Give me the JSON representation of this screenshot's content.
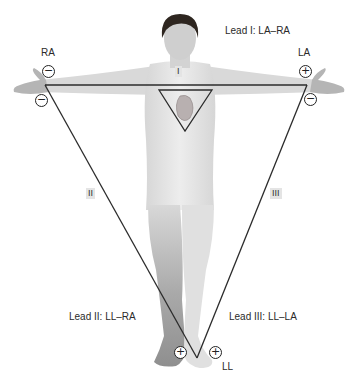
{
  "diagram": {
    "type": "einthoven-triangle",
    "electrodes": {
      "ra": {
        "label": "RA"
      },
      "la": {
        "label": "LA"
      },
      "ll": {
        "label": "LL"
      }
    },
    "leads": [
      {
        "id": "I",
        "roman": "I",
        "caption": "Lead I: LA–RA"
      },
      {
        "id": "II",
        "roman": "II",
        "caption": "Lead II: LL–RA"
      },
      {
        "id": "III",
        "roman": "III",
        "caption": "Lead III: LL–LA"
      }
    ],
    "polarity": {
      "ra_top": "−",
      "ra_bottom": "−",
      "la_top": "+",
      "la_bottom": "−",
      "ll_left": "+",
      "ll_right": "+"
    },
    "colors": {
      "line": "#2b2b2b",
      "skin_light": "#e6e6e6",
      "skin_mid": "#c9c9c9",
      "skin_dark": "#9a9a9a",
      "hair": "#2e2620",
      "heart": "#b8b0b0",
      "label_box": "#e4e4e4"
    }
  }
}
